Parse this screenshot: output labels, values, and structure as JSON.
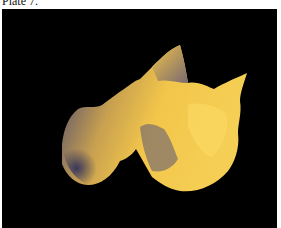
{
  "caption": "Plate 7.",
  "image": {
    "description": "3D rendered golden surface plot on black background",
    "surface_color": "#e8b840",
    "shadow_color": "#4a4a7a",
    "background_color": "#000000"
  }
}
